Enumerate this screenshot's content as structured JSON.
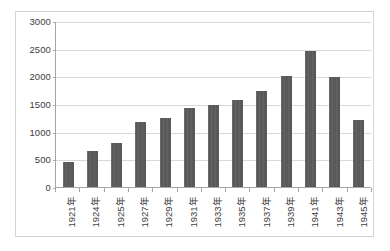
{
  "chart_data": {
    "type": "bar",
    "title": "",
    "xlabel": "",
    "ylabel": "",
    "ylim": [
      0,
      3000
    ],
    "grid": true,
    "legend": "none",
    "y_ticks": [
      3000,
      2500,
      2000,
      1500,
      1000,
      500,
      0
    ],
    "y_tick_labels": [
      "3000",
      "2500",
      "2000",
      "1500",
      "1000",
      "500",
      "0"
    ],
    "categories": [
      "1921年",
      "1924年",
      "1925年",
      "1927年",
      "1929年",
      "1931年",
      "1933年",
      "1935年",
      "1937年",
      "1939年",
      "1941年",
      "1943年",
      "1945年"
    ],
    "values": [
      460,
      650,
      800,
      1180,
      1250,
      1430,
      1480,
      1580,
      1740,
      2000,
      2450,
      1980,
      1210
    ],
    "series": [
      {
        "name": "series1",
        "color": "#595959",
        "values": [
          460,
          650,
          800,
          1180,
          1250,
          1430,
          1480,
          1580,
          1740,
          2000,
          2450,
          1980,
          1210
        ]
      }
    ]
  },
  "colors": {
    "bar": "#595959",
    "gridline": "#d9d9d9",
    "axis": "#a6a6a6",
    "border": "#d4d4d4",
    "background": "#ffffff",
    "text": "#404040"
  }
}
